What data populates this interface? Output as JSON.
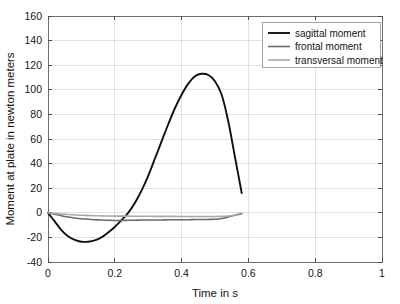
{
  "chart_data": {
    "type": "line",
    "title": "",
    "xlabel": "Time in s",
    "ylabel": "Moment at plate in newton meters",
    "xlim": [
      0,
      1
    ],
    "ylim": [
      -40,
      160
    ],
    "xticks": [
      "0",
      "0.2",
      "0.4",
      "0.6",
      "0.8",
      "1"
    ],
    "xtick_values": [
      0,
      0.2,
      0.4,
      0.6,
      0.8,
      1
    ],
    "yticks": [
      "-40",
      "-20",
      "0",
      "20",
      "40",
      "60",
      "80",
      "100",
      "120",
      "140",
      "160"
    ],
    "ytick_values": [
      -40,
      -20,
      0,
      20,
      40,
      60,
      80,
      100,
      120,
      140,
      160
    ],
    "grid": true,
    "legend_position": "top-right",
    "series": [
      {
        "name": "sagittal moment",
        "color": "#111111",
        "width": 1.9,
        "x": [
          0.0,
          0.02,
          0.04,
          0.06,
          0.08,
          0.1,
          0.12,
          0.14,
          0.16,
          0.18,
          0.2,
          0.22,
          0.24,
          0.26,
          0.28,
          0.3,
          0.32,
          0.34,
          0.36,
          0.38,
          0.4,
          0.42,
          0.44,
          0.46,
          0.48,
          0.5,
          0.52,
          0.54,
          0.56,
          0.58
        ],
        "y": [
          0,
          -7,
          -14,
          -19,
          -22,
          -23.5,
          -23.5,
          -22.5,
          -20,
          -16,
          -11.5,
          -6,
          0,
          8,
          18,
          30,
          44,
          58,
          72,
          85,
          96,
          105,
          111,
          113,
          112,
          107,
          96,
          74,
          45,
          16
        ]
      },
      {
        "name": "frontal moment",
        "color": "#6b6b6b",
        "width": 1.6,
        "x": [
          0.0,
          0.02,
          0.04,
          0.06,
          0.08,
          0.1,
          0.12,
          0.14,
          0.16,
          0.18,
          0.2,
          0.22,
          0.24,
          0.26,
          0.28,
          0.3,
          0.32,
          0.34,
          0.36,
          0.38,
          0.4,
          0.42,
          0.44,
          0.46,
          0.48,
          0.5,
          0.52,
          0.54,
          0.56,
          0.58
        ],
        "y": [
          0,
          -1.2,
          -2.4,
          -3.4,
          -4.2,
          -4.8,
          -5.2,
          -5.6,
          -5.9,
          -6.1,
          -6.2,
          -6.2,
          -6.1,
          -6.0,
          -5.9,
          -5.9,
          -5.8,
          -5.8,
          -5.7,
          -5.7,
          -5.6,
          -5.6,
          -5.5,
          -5.5,
          -5.4,
          -5.2,
          -4.6,
          -3.4,
          -1.8,
          -0.6
        ]
      },
      {
        "name": "transversal moment",
        "color": "#a8a8a8",
        "width": 1.6,
        "x": [
          0.0,
          0.02,
          0.04,
          0.06,
          0.08,
          0.1,
          0.12,
          0.14,
          0.16,
          0.18,
          0.2,
          0.22,
          0.24,
          0.26,
          0.28,
          0.3,
          0.32,
          0.34,
          0.36,
          0.38,
          0.4,
          0.42,
          0.44,
          0.46,
          0.48,
          0.5,
          0.52,
          0.54,
          0.56,
          0.58
        ],
        "y": [
          0,
          -0.5,
          -1.0,
          -1.4,
          -1.7,
          -2.0,
          -2.2,
          -2.4,
          -2.5,
          -2.6,
          -2.7,
          -2.7,
          -2.7,
          -2.8,
          -2.8,
          -2.8,
          -2.9,
          -2.9,
          -2.9,
          -2.9,
          -3.0,
          -3.0,
          -3.0,
          -3.0,
          -3.0,
          -3.0,
          -2.9,
          -2.6,
          -2.0,
          -1.2
        ]
      }
    ]
  },
  "legend": {
    "entries": [
      {
        "label": "sagittal moment"
      },
      {
        "label": "frontal moment"
      },
      {
        "label": "transversal moment"
      }
    ]
  }
}
